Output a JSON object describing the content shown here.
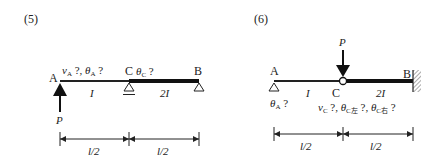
{
  "diagrams": [
    {
      "label": "(5)",
      "nodes": {
        "A": "A",
        "B": "B",
        "C": "C"
      },
      "unknowns_A": {
        "v": "v",
        "v_sub": "A",
        "mid": " ?, ",
        "theta": "θ",
        "theta_sub": "A",
        "q": " ?"
      },
      "unknowns_C": {
        "theta": "θ",
        "theta_sub": "C",
        "q": " ?"
      },
      "segment_AC": "I",
      "segment_CB": "2I",
      "load": "P",
      "dims": [
        "l/2",
        "l/2"
      ]
    },
    {
      "label": "(6)",
      "nodes": {
        "A": "A",
        "B": "B",
        "C": "C"
      },
      "unknowns_A": {
        "theta": "θ",
        "theta_sub": "A",
        "q": " ?"
      },
      "unknowns_C": {
        "v": "v",
        "v_sub": "C",
        "q1": " ?, ",
        "theta1": "θ",
        "theta1_sub": "C左",
        "q2": " ?, ",
        "theta2": "θ",
        "theta2_sub": "C右",
        "q3": " ?"
      },
      "segment_AC": "I",
      "segment_CB": "2I",
      "load": "P",
      "dims": [
        "l/2",
        "l/2"
      ]
    }
  ]
}
